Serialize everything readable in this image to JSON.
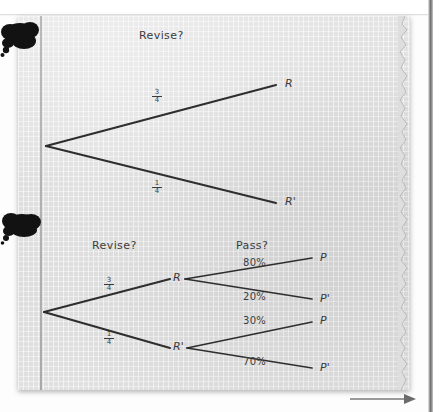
{
  "page": {
    "kind": "scanned-textbook-page",
    "background_color": "#dedede",
    "ink_color": "#3a3a3a"
  },
  "top_tree": {
    "header": "Revise?",
    "root": {
      "label": ""
    },
    "branches": [
      {
        "probability_numerator": "3",
        "probability_denominator": "4",
        "outcome": "R"
      },
      {
        "probability_numerator": "1",
        "probability_denominator": "4",
        "outcome": "R'"
      }
    ]
  },
  "bottom_tree": {
    "headers": [
      "Revise?",
      "Pass?"
    ],
    "stage1": [
      {
        "probability_numerator": "3",
        "probability_denominator": "4",
        "outcome": "R"
      },
      {
        "probability_numerator": "1",
        "probability_denominator": "4",
        "outcome": "R'"
      }
    ],
    "stage2": [
      {
        "from": "R",
        "probability": "80%",
        "outcome": "P"
      },
      {
        "from": "R",
        "probability": "20%",
        "outcome": "P'"
      },
      {
        "from": "R'",
        "probability": "30%",
        "outcome": "P"
      },
      {
        "from": "R'",
        "probability": "70%",
        "outcome": "P'"
      }
    ]
  },
  "decorations": {
    "blots": [
      "ink-blot-thought-bubble",
      "ink-blot-thought-bubble"
    ],
    "arrow": "right-arrow"
  }
}
